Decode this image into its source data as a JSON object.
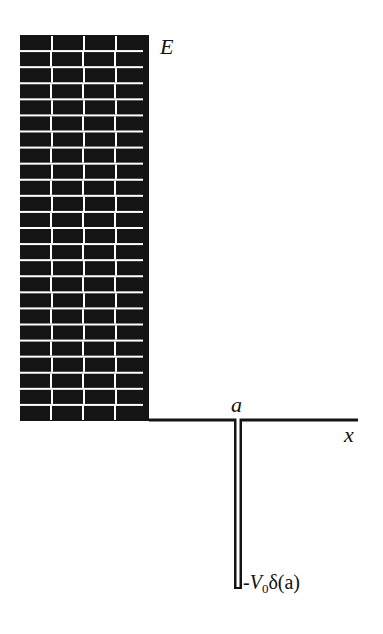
{
  "diagram": {
    "type": "potential-well-diagram",
    "labels": {
      "energy": "E",
      "position_a": "a",
      "x_axis": "x",
      "potential_prefix": "-",
      "potential_symbol": "V",
      "potential_subscript": "0",
      "potential_suffix": "δ(a)"
    },
    "colors": {
      "wall": "#141414",
      "mortar": "#ffffff",
      "line": "#141414",
      "background": "#ffffff"
    },
    "wall": {
      "x": 20,
      "y": 35,
      "width": 129,
      "height": 386,
      "brick_rows": 24,
      "brick_width": 32
    },
    "axis": {
      "y": 420,
      "x_start": 149,
      "x_end": 358
    },
    "well": {
      "x": 234,
      "width": 8,
      "y_top": 420,
      "y_bottom": 589
    }
  }
}
